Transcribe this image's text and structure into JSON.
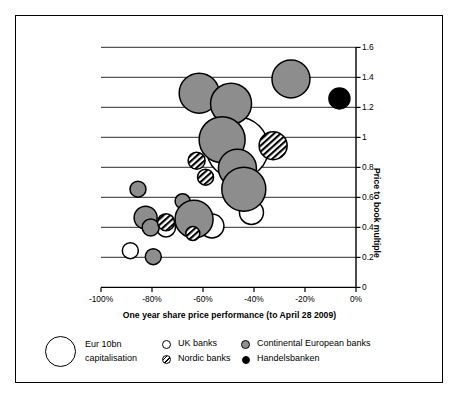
{
  "chart_data": {
    "type": "scatter",
    "title": "",
    "xlabel": "One year share price performance (to April 28 2009)",
    "ylabel": "Price to book multiple",
    "xlim": [
      -100,
      0
    ],
    "ylim": [
      0,
      1.6
    ],
    "xticks": [
      "-100%",
      "-80%",
      "-60%",
      "-40%",
      "-20%",
      "0%"
    ],
    "xtick_values": [
      -100,
      -80,
      -60,
      -40,
      -20,
      0
    ],
    "yticks": [
      "0",
      "0.2",
      "0.4",
      "0.6",
      "0.8",
      "1",
      "1.2",
      "1.4",
      "1.6"
    ],
    "ytick_values": [
      0,
      0.2,
      0.4,
      0.6,
      0.8,
      1,
      1.2,
      1.4,
      1.6
    ],
    "grid": "horizontal",
    "legend_position": "below",
    "size_note": "Bubble area proportional to market capitalisation; reference bubble = Eur 10bn",
    "series": [
      {
        "name": "UK banks",
        "marker": "open-circle",
        "color": "#ffffff",
        "points": [
          {
            "x": -46.5,
            "y": 0.93,
            "r_px": 31
          },
          {
            "x": -88.5,
            "y": 0.245,
            "r_px": 8
          },
          {
            "x": -74.5,
            "y": 0.4,
            "r_px": 9.5
          },
          {
            "x": -56.5,
            "y": 0.41,
            "r_px": 12
          },
          {
            "x": -41.0,
            "y": 0.5,
            "r_px": 12
          }
        ]
      },
      {
        "name": "Nordic banks",
        "marker": "hatched-circle",
        "color": "#808080",
        "points": [
          {
            "x": -32.5,
            "y": 0.945,
            "r_px": 14
          },
          {
            "x": -62.5,
            "y": 0.845,
            "r_px": 8.5
          },
          {
            "x": -59.0,
            "y": 0.735,
            "r_px": 8
          },
          {
            "x": -74.5,
            "y": 0.435,
            "r_px": 8.5
          },
          {
            "x": -64.0,
            "y": 0.36,
            "r_px": 7
          }
        ]
      },
      {
        "name": "Continental European banks",
        "marker": "filled-gray-circle",
        "color": "#8d8d8d",
        "points": [
          {
            "x": -25.5,
            "y": 1.39,
            "r_px": 19
          },
          {
            "x": -61.5,
            "y": 1.295,
            "r_px": 20
          },
          {
            "x": -49.0,
            "y": 1.225,
            "r_px": 20.5
          },
          {
            "x": -52.5,
            "y": 0.985,
            "r_px": 23
          },
          {
            "x": -46.5,
            "y": 0.795,
            "r_px": 19
          },
          {
            "x": -44.0,
            "y": 0.655,
            "r_px": 22
          },
          {
            "x": -85.5,
            "y": 0.655,
            "r_px": 8
          },
          {
            "x": -68.0,
            "y": 0.575,
            "r_px": 7.5
          },
          {
            "x": -63.5,
            "y": 0.455,
            "r_px": 19
          },
          {
            "x": -82.5,
            "y": 0.465,
            "r_px": 11.5
          },
          {
            "x": -80.5,
            "y": 0.4,
            "r_px": 8.5
          },
          {
            "x": -79.5,
            "y": 0.205,
            "r_px": 8
          }
        ]
      },
      {
        "name": "Handelsbanken",
        "marker": "filled-black-circle",
        "color": "#000000",
        "points": [
          {
            "x": -6.5,
            "y": 1.26,
            "r_px": 10.5
          }
        ]
      }
    ]
  },
  "legend": {
    "size_reference": {
      "line1": "Eur 10bn",
      "line2": "capitalisation"
    },
    "items": [
      {
        "label": "UK banks",
        "marker": "open-circle"
      },
      {
        "label": "Continental European banks",
        "marker": "filled-gray-circle"
      },
      {
        "label": "Nordic banks",
        "marker": "hatched-circle"
      },
      {
        "label": "Handelsbanken",
        "marker": "filled-black-circle"
      }
    ]
  },
  "colors": {
    "continental": "#8d8d8d",
    "handelsbanken": "#000000",
    "uk": "#ffffff",
    "nordic_hatch": "#000000",
    "gridline": "#555555",
    "axis": "#000000",
    "frame": "#000000",
    "background": "#ffffff"
  }
}
